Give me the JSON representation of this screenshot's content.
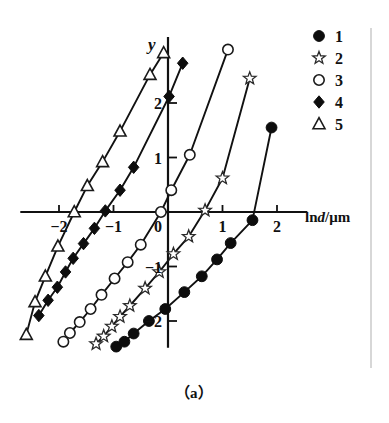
{
  "figure": {
    "caption": "（a）",
    "axis_y_label": "y",
    "axis_x_label_prefix": "ln",
    "axis_x_label_italic": "d",
    "axis_x_label_suffix": "/μm"
  },
  "legend": {
    "position": "top-right",
    "items": [
      {
        "label": "1",
        "marker": "filled-circle-icon"
      },
      {
        "label": "2",
        "marker": "open-star-icon"
      },
      {
        "label": "3",
        "marker": "open-circle-icon"
      },
      {
        "label": "4",
        "marker": "filled-diamond-icon"
      },
      {
        "label": "5",
        "marker": "open-triangle-icon"
      }
    ]
  },
  "chart_data": {
    "type": "scatter",
    "title": "",
    "subtitle": "",
    "xlabel": "lnd/μm",
    "ylabel": "y",
    "xlim": [
      -2.6,
      2.3
    ],
    "ylim": [
      -2.6,
      3.1
    ],
    "xticks": [
      -2,
      -1,
      0,
      1,
      2
    ],
    "xticklabels": [
      "−2",
      "−1",
      "0",
      "1",
      "2"
    ],
    "yticks": [
      -2,
      -1,
      1,
      2
    ],
    "yticklabels": [
      "−2",
      "−1",
      "1",
      "2"
    ],
    "grid": false,
    "legend_position": "top-right",
    "annotations": [
      "（a）"
    ],
    "series": [
      {
        "name": "1",
        "marker": "filled-circle",
        "x": [
          -0.95,
          -0.8,
          -0.63,
          -0.35,
          -0.05,
          0.3,
          0.62,
          0.9,
          1.15,
          1.55,
          1.9
        ],
        "y": [
          -2.47,
          -2.38,
          -2.23,
          -2.0,
          -1.78,
          -1.47,
          -1.18,
          -0.87,
          -0.57,
          -0.15,
          1.55
        ]
      },
      {
        "name": "2",
        "marker": "open-star",
        "x": [
          -1.32,
          -1.18,
          -1.03,
          -0.88,
          -0.7,
          -0.42,
          -0.16,
          0.1,
          0.38,
          0.68,
          1.0,
          1.5
        ],
        "y": [
          -2.42,
          -2.28,
          -2.1,
          -1.92,
          -1.72,
          -1.4,
          -1.1,
          -0.77,
          -0.45,
          0.03,
          0.62,
          2.45
        ]
      },
      {
        "name": "3",
        "marker": "open-circle",
        "x": [
          -1.92,
          -1.8,
          -1.62,
          -1.42,
          -1.22,
          -0.98,
          -0.74,
          -0.5,
          -0.13,
          0.06,
          0.4,
          1.1
        ],
        "y": [
          -2.38,
          -2.22,
          -2.02,
          -1.78,
          -1.52,
          -1.22,
          -0.92,
          -0.6,
          0.0,
          0.4,
          1.05,
          2.98
        ]
      },
      {
        "name": "4",
        "marker": "filled-diamond",
        "x": [
          -2.37,
          -2.2,
          -2.03,
          -1.88,
          -1.74,
          -1.55,
          -1.35,
          -1.15,
          -0.88,
          -0.63,
          0.02,
          0.27
        ],
        "y": [
          -1.9,
          -1.62,
          -1.38,
          -1.1,
          -0.85,
          -0.58,
          -0.3,
          0.02,
          0.4,
          0.82,
          2.12,
          2.73
        ]
      },
      {
        "name": "5",
        "marker": "open-triangle",
        "x": [
          -2.6,
          -2.44,
          -2.25,
          -2.02,
          -1.72,
          -1.48,
          -1.2,
          -0.88,
          -0.33,
          -0.08
        ],
        "y": [
          -2.25,
          -1.65,
          -1.18,
          -0.63,
          0.0,
          0.48,
          0.92,
          1.48,
          2.52,
          2.92
        ]
      }
    ]
  }
}
